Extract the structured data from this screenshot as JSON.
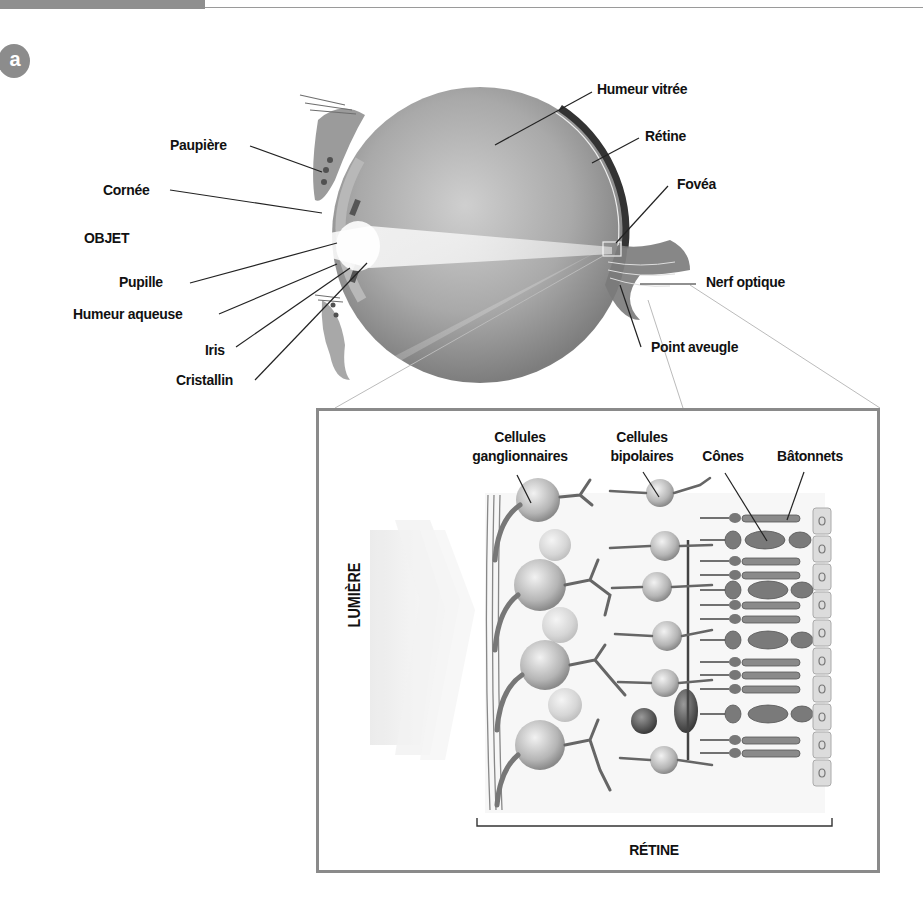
{
  "header": {
    "section_badge": "a"
  },
  "eye_diagram": {
    "labels_left": [
      {
        "id": "paupiere",
        "text": "Paupière"
      },
      {
        "id": "cornee",
        "text": "Cornée"
      },
      {
        "id": "objet",
        "text": "OBJET"
      },
      {
        "id": "pupille",
        "text": "Pupille"
      },
      {
        "id": "humeur-aqueuse",
        "text": "Humeur aqueuse"
      },
      {
        "id": "iris",
        "text": "Iris"
      },
      {
        "id": "cristallin",
        "text": "Cristallin"
      }
    ],
    "labels_right": [
      {
        "id": "humeur-vitree",
        "text": "Humeur vitrée"
      },
      {
        "id": "retine",
        "text": "Rétine"
      },
      {
        "id": "fovea",
        "text": "Fovéa"
      },
      {
        "id": "nerf-optique",
        "text": "Nerf optique"
      },
      {
        "id": "point-aveugle",
        "text": "Point aveugle"
      }
    ]
  },
  "retina_inset": {
    "labels_top": [
      {
        "id": "cellules-ganglionnaires",
        "line1": "Cellules",
        "line2": "ganglionnaires"
      },
      {
        "id": "cellules-bipolaires",
        "line1": "Cellules",
        "line2": "bipolaires"
      },
      {
        "id": "cones",
        "line1": "",
        "line2": "Cônes"
      },
      {
        "id": "batonnets",
        "line1": "",
        "line2": "Bâtonnets"
      }
    ],
    "light_label": "LUMIÈRE",
    "bracket_label": "RÉTINE"
  },
  "colors": {
    "frame_gray": "#8a8a8a",
    "badge_gray": "#8c8c8c",
    "ink": "#111111"
  }
}
